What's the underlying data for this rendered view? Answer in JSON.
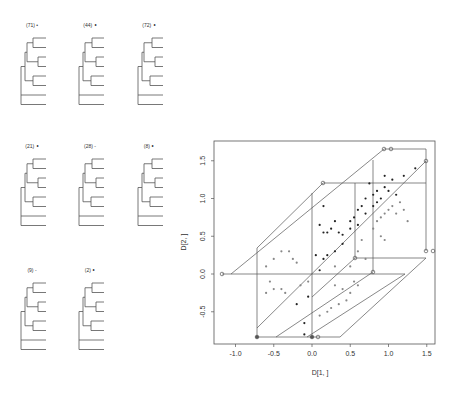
{
  "trees": [
    {
      "label": "(71) •",
      "x": 20,
      "y": 27
    },
    {
      "label": "(44) ∘",
      "x": 78,
      "y": 27
    },
    {
      "label": "(72) ∘",
      "x": 137,
      "y": 27
    },
    {
      "label": "(21) ∘",
      "x": 20,
      "y": 148
    },
    {
      "label": "(28) -",
      "x": 78,
      "y": 148
    },
    {
      "label": "(8) ∘",
      "x": 137,
      "y": 148
    },
    {
      "label": "(9) -",
      "x": 20,
      "y": 272
    },
    {
      "label": "(2) ∘",
      "x": 78,
      "y": 272
    }
  ],
  "chart_data": {
    "type": "scatter",
    "title": "",
    "xlabel": "D[1, ]",
    "ylabel": "D[2, ]",
    "xlim": [
      -1.3,
      1.6
    ],
    "ylim": [
      -0.9,
      1.75
    ],
    "x_ticks": [
      "-1.0",
      "-0.5",
      "0.0",
      "0.5",
      "1.0",
      "1.5"
    ],
    "y_ticks": [
      "-0.5",
      "0.0",
      "0.5",
      "1.0",
      "1.5"
    ],
    "grid": false,
    "legend": null,
    "series": [
      {
        "name": "dark points",
        "color": "#222222",
        "points": [
          [
            0.05,
            0.25
          ],
          [
            0.15,
            0.9
          ],
          [
            0.1,
            0.65
          ],
          [
            0.15,
            0.55
          ],
          [
            0.2,
            0.55
          ],
          [
            0.25,
            0.6
          ],
          [
            0.3,
            0.7
          ],
          [
            0.35,
            0.55
          ],
          [
            0.4,
            0.52
          ],
          [
            0.5,
            0.7
          ],
          [
            0.5,
            0.6
          ],
          [
            0.55,
            0.75
          ],
          [
            0.6,
            0.65
          ],
          [
            0.6,
            0.85
          ],
          [
            0.65,
            0.9
          ],
          [
            0.7,
            0.8
          ],
          [
            0.7,
            1.0
          ],
          [
            0.75,
            1.2
          ],
          [
            0.8,
            1.05
          ],
          [
            0.8,
            0.9
          ],
          [
            0.85,
            1.1
          ],
          [
            0.85,
            0.95
          ],
          [
            0.9,
            1.0
          ],
          [
            0.95,
            1.15
          ],
          [
            0.95,
            1.3
          ],
          [
            1.0,
            1.1
          ],
          [
            1.05,
            1.25
          ],
          [
            1.1,
            1.05
          ],
          [
            1.2,
            1.3
          ],
          [
            1.35,
            1.4
          ],
          [
            0.1,
            0.05
          ],
          [
            0.15,
            0.2
          ],
          [
            0.2,
            0.25
          ],
          [
            0.3,
            0.3
          ],
          [
            0.4,
            0.4
          ],
          [
            -0.2,
            -0.4
          ],
          [
            -0.1,
            -0.65
          ],
          [
            -0.1,
            -0.8
          ],
          [
            -0.05,
            -0.3
          ]
        ]
      },
      {
        "name": "gray points",
        "color": "#888888",
        "points": [
          [
            -0.5,
            0.2
          ],
          [
            -0.4,
            0.3
          ],
          [
            -0.3,
            0.3
          ],
          [
            -0.25,
            0.2
          ],
          [
            -0.2,
            0.15
          ],
          [
            -0.6,
            0.1
          ],
          [
            -0.55,
            -0.1
          ],
          [
            -0.6,
            -0.25
          ],
          [
            -0.5,
            -0.2
          ],
          [
            -0.4,
            -0.2
          ],
          [
            -0.35,
            -0.25
          ],
          [
            -0.15,
            -0.15
          ],
          [
            -0.05,
            -0.1
          ],
          [
            0.3,
            0.1
          ],
          [
            0.5,
            0.1
          ],
          [
            0.6,
            0.3
          ],
          [
            0.7,
            0.2
          ],
          [
            0.65,
            0.45
          ],
          [
            0.8,
            0.6
          ],
          [
            0.85,
            0.7
          ],
          [
            0.9,
            0.75
          ],
          [
            0.95,
            0.8
          ],
          [
            1.0,
            0.85
          ],
          [
            1.05,
            0.9
          ],
          [
            1.1,
            0.8
          ],
          [
            1.15,
            0.95
          ],
          [
            1.2,
            0.85
          ],
          [
            1.25,
            0.7
          ],
          [
            0.9,
            0.5
          ],
          [
            0.95,
            0.45
          ],
          [
            0.3,
            -0.15
          ],
          [
            0.4,
            -0.2
          ],
          [
            0.5,
            -0.25
          ],
          [
            0.45,
            -0.35
          ],
          [
            0.35,
            -0.4
          ],
          [
            0.25,
            -0.45
          ],
          [
            0.2,
            -0.5
          ],
          [
            0.1,
            -0.55
          ],
          [
            0.55,
            -0.1
          ],
          [
            0.6,
            -0.15
          ]
        ]
      }
    ]
  }
}
